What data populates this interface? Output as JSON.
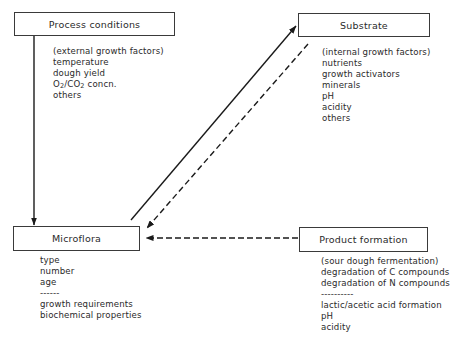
{
  "nodes": {
    "process": {
      "title": "Process conditions",
      "items": [
        "(external growth factors)",
        "temperature",
        "dough yield",
        "O2/CO2 concn.",
        "others"
      ]
    },
    "substrate": {
      "title": "Substrate",
      "items": [
        "(internal growth factors)",
        "nutrients",
        "growth activators",
        "minerals",
        "pH",
        "acidity",
        "others"
      ]
    },
    "microflora": {
      "title": "Microflora",
      "items": [
        "type",
        "number",
        "age",
        "------",
        "growth requirements",
        "biochemical properties"
      ]
    },
    "product": {
      "title": "Product formation",
      "items": [
        "(sour dough fermentation)",
        "degradation of C compounds",
        "degradation of N compounds",
        "----------",
        "lactic/acetic acid formation",
        "pH",
        "acidity"
      ]
    }
  },
  "edges": [
    {
      "from": "Process conditions",
      "to": "Microflora",
      "style": "solid"
    },
    {
      "from": "Microflora",
      "to": "Substrate",
      "style": "solid"
    },
    {
      "from": "Substrate",
      "to": "Microflora",
      "style": "dashed"
    },
    {
      "from": "Product formation",
      "to": "Microflora",
      "style": "dashed"
    }
  ],
  "colors": {
    "line": "#1a1a1a",
    "text": "#2a2a2a",
    "background": "#ffffff"
  }
}
